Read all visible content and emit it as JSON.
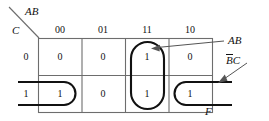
{
  "diagram": {
    "kind": "karnaugh-map",
    "corner": {
      "col_var_label": "AB",
      "row_var_label": "C"
    },
    "column_headers": [
      "00",
      "01",
      "11",
      "10"
    ],
    "row_headers": [
      "0",
      "1"
    ],
    "cells": [
      [
        "0",
        "0",
        "1",
        "0"
      ],
      [
        "1",
        "0",
        "1",
        "1"
      ]
    ],
    "annotations": {
      "group_ab_label": "AB",
      "group_bc_label_b": "B",
      "group_bc_label_c": "C",
      "output_label": "F"
    }
  },
  "colors": {
    "grid_line": "#6d6d6d",
    "group_line": "#111111",
    "arrow_line": "#555555",
    "text": "#111111",
    "background": "#ffffff"
  }
}
